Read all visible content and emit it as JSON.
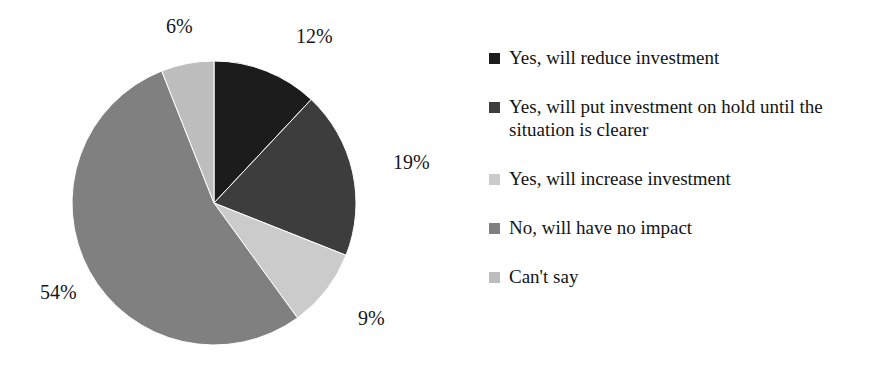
{
  "chart_data": {
    "type": "pie",
    "title": "",
    "subtitle": "",
    "xlabel": "",
    "ylabel": "",
    "grid": false,
    "legend_position": "right",
    "unit": "%",
    "start_angle_deg": 0,
    "direction": "clockwise",
    "categories": [
      "Yes, will reduce investment",
      "Yes, will put investment on hold until the situation is clearer",
      "Yes, will increase investment",
      "No, will have no impact",
      "Can't say"
    ],
    "values": [
      12,
      19,
      9,
      54,
      6
    ],
    "value_labels": [
      "12%",
      "19%",
      "9%",
      "54%",
      "6%"
    ],
    "colors": [
      "#1c1c1c",
      "#3d3d3d",
      "#cbcbcb",
      "#808080",
      "#bdbdbd"
    ],
    "slices": [
      {
        "label": "Yes, will reduce investment",
        "value": 12,
        "display": "12%",
        "color": "#1c1c1c"
      },
      {
        "label": "Yes, will put investment on hold until the situation is clearer",
        "value": 19,
        "display": "19%",
        "color": "#3d3d3d"
      },
      {
        "label": "Yes, will increase investment",
        "value": 9,
        "display": "9%",
        "color": "#cbcbcb"
      },
      {
        "label": "No, will have no impact",
        "value": 54,
        "display": "54%",
        "color": "#808080"
      },
      {
        "label": "Can't say",
        "value": 6,
        "display": "6%",
        "color": "#bdbdbd"
      }
    ]
  },
  "legend": {
    "items": [
      {
        "label": "Yes, will reduce investment",
        "color": "#1c1c1c"
      },
      {
        "label": "Yes, will put investment on hold until the situation is clearer",
        "color": "#3d3d3d"
      },
      {
        "label": "Yes, will increase investment",
        "color": "#cbcbcb"
      },
      {
        "label": "No, will have no impact",
        "color": "#808080"
      },
      {
        "label": "Can't say",
        "color": "#bdbdbd"
      }
    ]
  },
  "canvas": {
    "background": "#ffffff",
    "pie_center_x": 214,
    "pie_center_y": 203,
    "pie_radius": 142
  }
}
